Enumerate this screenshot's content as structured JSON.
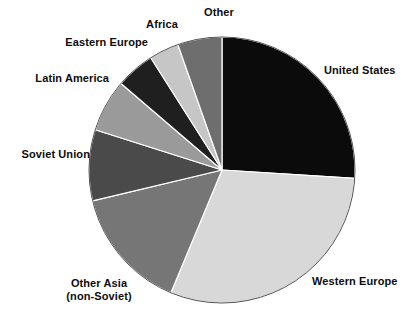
{
  "chart_data": {
    "type": "pie",
    "title": "",
    "subtitle": "",
    "xlabel": "",
    "ylabel": "",
    "legend_position": "none",
    "grid": false,
    "start_angle_deg": 0,
    "direction": "clockwise",
    "categories": [
      "United States",
      "Western Europe",
      "Other Asia (non-Soviet)",
      "Soviet Union",
      "Latin America",
      "Eastern Europe",
      "Africa",
      "Other"
    ],
    "values": [
      26.0,
      30.3,
      15.0,
      8.6,
      6.4,
      4.7,
      3.6,
      5.4
    ],
    "slices": [
      {
        "label": "United States",
        "label_line1": "United States",
        "label_line2": "",
        "value": 26.0,
        "start_deg": 0,
        "end_deg": 93.6,
        "color": "#0b0b0b"
      },
      {
        "label": "Western Europe",
        "label_line1": "Western Europe",
        "label_line2": "",
        "value": 30.3,
        "start_deg": 93.6,
        "end_deg": 202.6,
        "color": "#d8d8d8"
      },
      {
        "label": "Other Asia (non-Soviet)",
        "label_line1": "Other Asia",
        "label_line2": "(non-Soviet)",
        "value": 15.0,
        "start_deg": 202.6,
        "end_deg": 256.6,
        "color": "#767676"
      },
      {
        "label": "Soviet Union",
        "label_line1": "Soviet Union",
        "label_line2": "",
        "value": 8.6,
        "start_deg": 256.6,
        "end_deg": 287.6,
        "color": "#4a4a4a"
      },
      {
        "label": "Latin America",
        "label_line1": "Latin America",
        "label_line2": "",
        "value": 6.4,
        "start_deg": 287.6,
        "end_deg": 310.6,
        "color": "#9a9a9a"
      },
      {
        "label": "Eastern Europe",
        "label_line1": "Eastern Europe",
        "label_line2": "",
        "value": 4.7,
        "start_deg": 310.6,
        "end_deg": 327.6,
        "color": "#1f1f1f"
      },
      {
        "label": "Africa",
        "label_line1": "Africa",
        "label_line2": "",
        "value": 3.6,
        "start_deg": 327.6,
        "end_deg": 340.6,
        "color": "#c6c6c6"
      },
      {
        "label": "Other",
        "label_line1": "Other",
        "label_line2": "",
        "value": 5.4,
        "start_deg": 340.6,
        "end_deg": 360,
        "color": "#6e6e6e"
      }
    ],
    "geometry": {
      "cx": 222,
      "cy": 170,
      "r": 133,
      "outline_color": "#555555"
    }
  },
  "labels": {
    "united_states": "United States",
    "western_europe": "Western Europe",
    "other_asia_l1": "Other Asia",
    "other_asia_l2": "(non-Soviet)",
    "soviet_union": "Soviet Union",
    "latin_america": "Latin America",
    "eastern_europe": "Eastern Europe",
    "africa": "Africa",
    "other": "Other"
  }
}
